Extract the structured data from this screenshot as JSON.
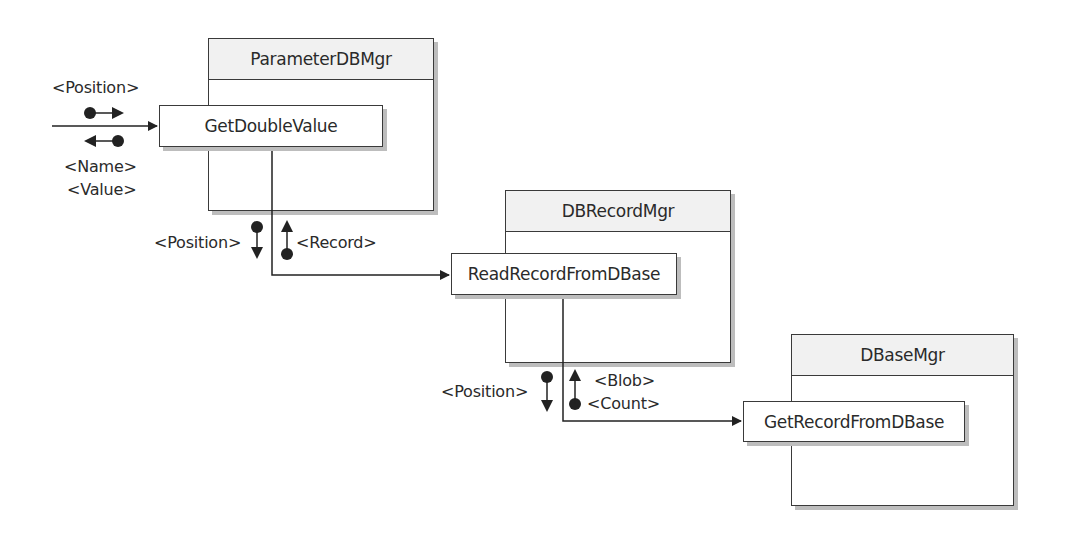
{
  "diagram": {
    "type": "structure-chart",
    "modules": [
      {
        "id": "parameter-db-mgr",
        "title": "ParameterDBMgr",
        "operation": "GetDoubleValue"
      },
      {
        "id": "db-record-mgr",
        "title": "DBRecordMgr",
        "operation": "ReadRecordFromDBase"
      },
      {
        "id": "dbase-mgr",
        "title": "DBaseMgr",
        "operation": "GetRecordFromDBase"
      }
    ],
    "couples": {
      "entry_in": "<Position>",
      "entry_out_1": "<Name>",
      "entry_out_2": "<Value>",
      "call1_in": "<Position>",
      "call1_out": "<Record>",
      "call2_in": "<Position>",
      "call2_out_1": "<Blob>",
      "call2_out_2": "<Count>"
    },
    "connections": [
      {
        "from": "external",
        "to": "GetDoubleValue",
        "down": [
          "<Position>"
        ],
        "up": [
          "<Name>",
          "<Value>"
        ]
      },
      {
        "from": "GetDoubleValue",
        "to": "ReadRecordFromDBase",
        "down": [
          "<Position>"
        ],
        "up": [
          "<Record>"
        ]
      },
      {
        "from": "ReadRecordFromDBase",
        "to": "GetRecordFromDBase",
        "down": [
          "<Position>"
        ],
        "up": [
          "<Blob>",
          "<Count>"
        ]
      }
    ]
  }
}
